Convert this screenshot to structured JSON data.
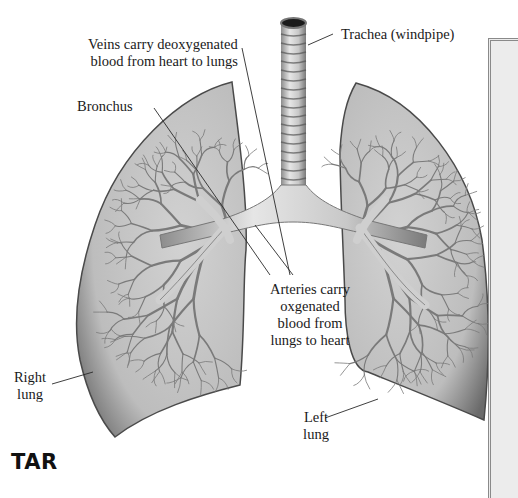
{
  "diagram": {
    "labels": {
      "veins": [
        "Veins carry deoxygenated",
        "blood from heart to lungs"
      ],
      "trachea": "Trachea (windpipe)",
      "bronchus": "Bronchus",
      "arteries": [
        "Arteries carry",
        "oxgenated",
        "blood from",
        "lungs to heart"
      ],
      "right_lung": [
        "Right",
        "lung"
      ],
      "left_lung": [
        "Left",
        "lung"
      ]
    },
    "brand_text": "TAR",
    "colors": {
      "lung_fill": "#c4c4c4",
      "lung_edge": "#555555",
      "vessel": "#7d7d7d",
      "airway": "#d6d6d6",
      "leader_line": "#333333",
      "panel": "#ececec"
    }
  }
}
